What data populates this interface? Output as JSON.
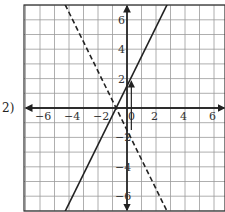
{
  "problem_label": "2)",
  "chart_data": {
    "type": "line",
    "title": "",
    "xlabel": "",
    "ylabel": "",
    "xlim": [
      -7,
      7
    ],
    "ylim": [
      -7,
      7
    ],
    "grid": true,
    "x_ticks": [
      -6,
      -4,
      -2,
      0,
      2,
      4,
      6
    ],
    "y_ticks": [
      -6,
      -4,
      -2,
      2,
      4,
      6
    ],
    "x_tick_labels": [
      "−6",
      "−4",
      "−2",
      "0",
      "2",
      "4",
      "6"
    ],
    "y_tick_labels": [
      "−6",
      "−4",
      "−2",
      "2",
      "4",
      "6"
    ],
    "series": [
      {
        "name": "solid line",
        "style": "solid",
        "equation": "y = 2x + 1.5",
        "points": [
          [
            -5,
            -8.5
          ],
          [
            3,
            7.5
          ]
        ]
      },
      {
        "name": "dashed line",
        "style": "dashed",
        "equation": "y = -2x - 1.5",
        "points": [
          [
            -5,
            8.5
          ],
          [
            3,
            -7.5
          ]
        ]
      },
      {
        "name": "vertical arrow",
        "style": "arrow",
        "points": [
          [
            0.3,
            -1.5
          ],
          [
            0.3,
            1.8
          ]
        ]
      }
    ],
    "colors": {
      "line": "#222222",
      "grid": "#9a9a9a",
      "axis": "#222222"
    }
  }
}
